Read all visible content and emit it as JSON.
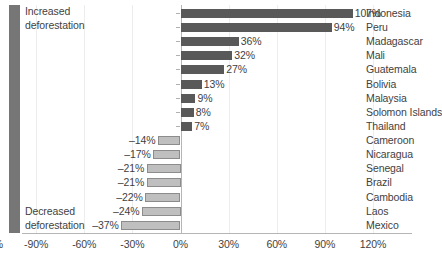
{
  "chart_data": {
    "type": "bar",
    "orientation": "horizontal",
    "title": "",
    "xlabel": "",
    "ylabel": "",
    "xlim": [
      -120,
      120
    ],
    "grid": true,
    "legend": "none",
    "tick_labels": [
      "-120%",
      "-90%",
      "-60%",
      "-30%",
      "0%",
      "30%",
      "60%",
      "90%",
      "120%"
    ],
    "tick_values": [
      -120,
      -90,
      -60,
      -30,
      0,
      30,
      60,
      90,
      120
    ],
    "categories": [
      "Indonesia",
      "Peru",
      "Madagascar",
      "Mali",
      "Guatemala",
      "Bolivia",
      "Malaysia",
      "Solomon Islands",
      "Thailand",
      "Cameroon",
      "Nicaragua",
      "Senegal",
      "Brazil",
      "Cambodia",
      "Laos",
      "Mexico"
    ],
    "values": [
      107,
      94,
      36,
      32,
      27,
      13,
      9,
      8,
      7,
      -14,
      -17,
      -21,
      -21,
      -22,
      -24,
      -37
    ],
    "value_labels": [
      "107%",
      "94%",
      "36%",
      "32%",
      "27%",
      "13%",
      "9%",
      "8%",
      "7%",
      "–14%",
      "–17%",
      "–21%",
      "–21%",
      "–22%",
      "–24%",
      "–37%"
    ],
    "annotations": [
      {
        "name": "increased-deforestation",
        "line1": "Increased",
        "line2": "deforestation"
      },
      {
        "name": "decreased-deforestation",
        "line1": "Decreased",
        "line2": "deforestation"
      }
    ],
    "colors": {
      "positive_bar": "#595959",
      "negative_bar": "#bfbfbf",
      "negative_bar_border": "#8c8c8c",
      "annotation_band": "#767676",
      "gridline": "#ededed",
      "axis": "#b5b5b5",
      "text": "#3f3f3f"
    }
  }
}
